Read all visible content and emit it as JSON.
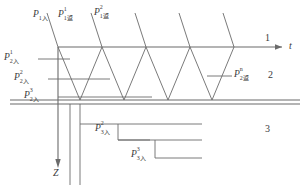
{
  "figure": {
    "axes": {
      "horizontal": {
        "name": "t",
        "label": "t",
        "direction": "right"
      },
      "vertical": {
        "name": "Z",
        "label": "Z",
        "direction": "down"
      }
    },
    "layers": [
      {
        "id": "layer-1",
        "label": "1"
      },
      {
        "id": "layer-2",
        "label": "2"
      },
      {
        "id": "layer-3",
        "label": "3"
      }
    ],
    "incident_labels": [
      {
        "id": "p-1-in",
        "base": "P",
        "sup": "",
        "sub": "1入"
      },
      {
        "id": "p-1-ret-1",
        "base": "P",
        "sup": "1",
        "sub": "1返"
      },
      {
        "id": "p-1-ret-2",
        "base": "P",
        "sup": "2",
        "sub": "1返"
      }
    ],
    "left_labels": [
      {
        "id": "p-2-in-1",
        "base": "P",
        "sup": "1",
        "sub": "2入"
      },
      {
        "id": "p-2-in-2",
        "base": "P",
        "sup": "2",
        "sub": "2入"
      },
      {
        "id": "p-2-in-3",
        "base": "P",
        "sup": "3",
        "sub": "2入"
      }
    ],
    "right_labels": [
      {
        "id": "p-2-ret-n",
        "base": "P",
        "sup": "n",
        "sub": "2返"
      }
    ],
    "bottom_labels": [
      {
        "id": "p-3-in-2",
        "base": "P",
        "sup": "2",
        "sub": "3入"
      },
      {
        "id": "p-3-in-3",
        "base": "P",
        "sup": "3",
        "sub": "3入"
      }
    ],
    "colors": {
      "line": "#6b6b6b",
      "text": "#3a3a3a",
      "background": "#ffffff"
    }
  }
}
